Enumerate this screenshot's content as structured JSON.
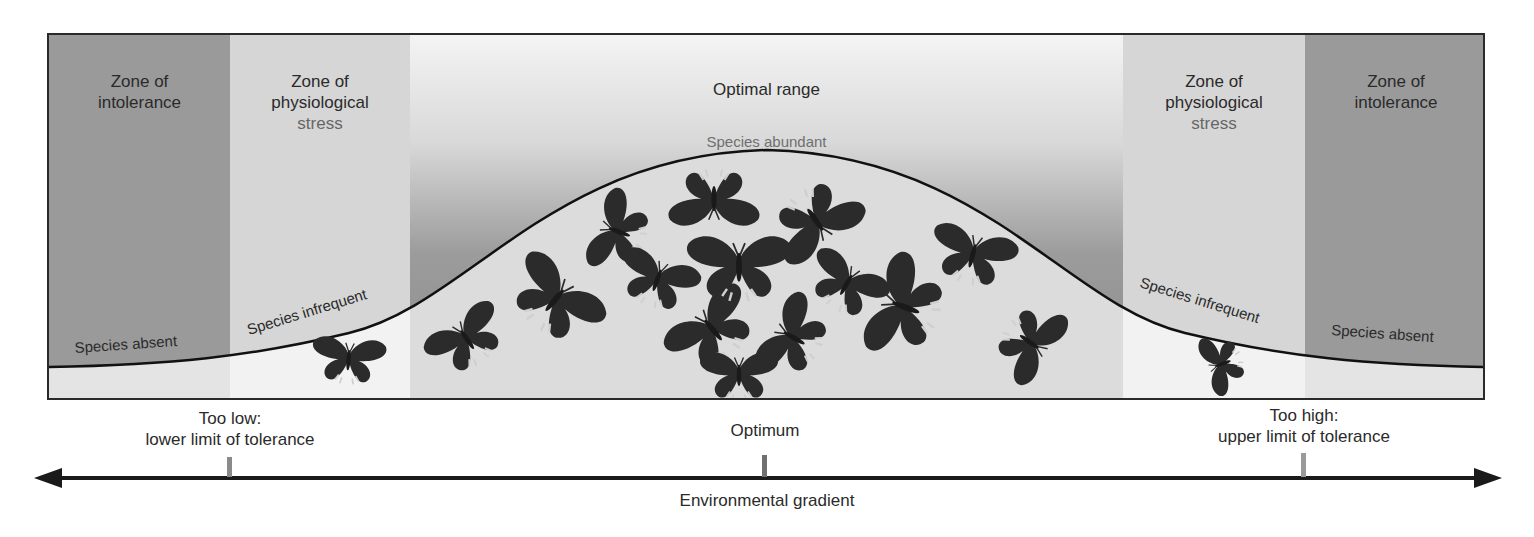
{
  "figure": {
    "zones": [
      {
        "id": "intolerance-low",
        "title_lines": [
          "Zone of",
          "intolerance"
        ],
        "curve_label": "Species absent",
        "fill": "#9a9a9a"
      },
      {
        "id": "stress-low",
        "title_lines": [
          "Zone of",
          "physiological",
          "stress"
        ],
        "curve_label": "Species infrequent",
        "fill": "#d4d4d4"
      },
      {
        "id": "optimal",
        "title_lines": [
          "Optimal range"
        ],
        "curve_label": "Species abundant",
        "fill_top": "#f2f2f2",
        "fill_bottom": "#8e8e8e"
      },
      {
        "id": "stress-high",
        "title_lines": [
          "Zone of",
          "physiological",
          "stress"
        ],
        "curve_label": "Species infrequent",
        "fill": "#d4d4d4"
      },
      {
        "id": "intolerance-high",
        "title_lines": [
          "Zone of",
          "intolerance"
        ],
        "curve_label": "Species absent",
        "fill": "#9a9a9a"
      }
    ],
    "markers": [
      {
        "id": "lower-limit",
        "lines": [
          "Too low:",
          "lower limit of tolerance"
        ]
      },
      {
        "id": "optimum",
        "lines": [
          "Optimum"
        ]
      },
      {
        "id": "upper-limit",
        "lines": [
          "Too high:",
          "upper limit of tolerance"
        ]
      }
    ],
    "axis": {
      "label": "Environmental gradient"
    },
    "colors": {
      "frame": "#2a2a2a",
      "curve": "#111111",
      "under_curve": "#e9e9e9",
      "butterfly": "#2b2b2b",
      "tick": "#8a8a8a"
    }
  }
}
